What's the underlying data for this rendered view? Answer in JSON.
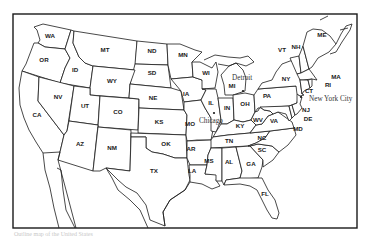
{
  "map": {
    "title": "",
    "frame_color": "#1a1a1a",
    "background": "#ffffff",
    "states": [
      {
        "abbr": "WA",
        "x": 50,
        "y": 38
      },
      {
        "abbr": "OR",
        "x": 44,
        "y": 62
      },
      {
        "abbr": "ID",
        "x": 75,
        "y": 72
      },
      {
        "abbr": "MT",
        "x": 105,
        "y": 52
      },
      {
        "abbr": "ND",
        "x": 152,
        "y": 53
      },
      {
        "abbr": "MN",
        "x": 183,
        "y": 57
      },
      {
        "abbr": "WY",
        "x": 112,
        "y": 83
      },
      {
        "abbr": "SD",
        "x": 152,
        "y": 75
      },
      {
        "abbr": "WI",
        "x": 206,
        "y": 75
      },
      {
        "abbr": "MI",
        "x": 232,
        "y": 88
      },
      {
        "abbr": "NV",
        "x": 58,
        "y": 99
      },
      {
        "abbr": "UT",
        "x": 85,
        "y": 108
      },
      {
        "abbr": "CO",
        "x": 118,
        "y": 114
      },
      {
        "abbr": "NE",
        "x": 153,
        "y": 100
      },
      {
        "abbr": "IA",
        "x": 186,
        "y": 96
      },
      {
        "abbr": "IL",
        "x": 211,
        "y": 105
      },
      {
        "abbr": "IN",
        "x": 227,
        "y": 110
      },
      {
        "abbr": "OH",
        "x": 245,
        "y": 106
      },
      {
        "abbr": "PA",
        "x": 267,
        "y": 98
      },
      {
        "abbr": "NY",
        "x": 286,
        "y": 81
      },
      {
        "abbr": "CA",
        "x": 37,
        "y": 117
      },
      {
        "abbr": "KS",
        "x": 159,
        "y": 124
      },
      {
        "abbr": "MO",
        "x": 190,
        "y": 126
      },
      {
        "abbr": "KY",
        "x": 240,
        "y": 128
      },
      {
        "abbr": "WV",
        "x": 258,
        "y": 122
      },
      {
        "abbr": "VA",
        "x": 274,
        "y": 123
      },
      {
        "abbr": "AZ",
        "x": 80,
        "y": 146
      },
      {
        "abbr": "NM",
        "x": 112,
        "y": 150
      },
      {
        "abbr": "OK",
        "x": 166,
        "y": 146
      },
      {
        "abbr": "TN",
        "x": 229,
        "y": 143
      },
      {
        "abbr": "NC",
        "x": 262,
        "y": 140
      },
      {
        "abbr": "AR",
        "x": 191,
        "y": 151
      },
      {
        "abbr": "SC",
        "x": 262,
        "y": 152
      },
      {
        "abbr": "MS",
        "x": 209,
        "y": 163
      },
      {
        "abbr": "AL",
        "x": 229,
        "y": 164
      },
      {
        "abbr": "GA",
        "x": 251,
        "y": 166
      },
      {
        "abbr": "LA",
        "x": 192,
        "y": 173
      },
      {
        "abbr": "TX",
        "x": 154,
        "y": 173
      },
      {
        "abbr": "FL",
        "x": 265,
        "y": 196
      },
      {
        "abbr": "ME",
        "x": 322,
        "y": 37
      },
      {
        "abbr": "VT",
        "x": 282,
        "y": 52
      },
      {
        "abbr": "NH",
        "x": 296,
        "y": 49
      },
      {
        "abbr": "MA",
        "x": 336,
        "y": 79
      },
      {
        "abbr": "RI",
        "x": 328,
        "y": 87
      },
      {
        "abbr": "CT",
        "x": 309,
        "y": 93
      },
      {
        "abbr": "NJ",
        "x": 306,
        "y": 112
      },
      {
        "abbr": "DE",
        "x": 308,
        "y": 121
      },
      {
        "abbr": "MD",
        "x": 298,
        "y": 131
      }
    ],
    "cities": [
      {
        "name": "Detroit",
        "x": 232,
        "y": 80,
        "marker_x": 243,
        "marker_y": 91
      },
      {
        "name": "Chicago",
        "x": 199,
        "y": 123,
        "marker_x": 214,
        "marker_y": 113
      },
      {
        "name": "New York City",
        "x": 309,
        "y": 101,
        "marker_x": 301,
        "marker_y": 97
      }
    ],
    "caption": "Outline map of the United States"
  }
}
